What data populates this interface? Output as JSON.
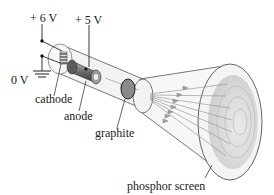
{
  "diagram": {
    "labels": {
      "v6": "+ 6 V",
      "v5": "+ 5 V",
      "v0": "0 V",
      "cathode": "cathode",
      "anode": "anode",
      "graphite": "graphite",
      "screen": "phosphor screen"
    },
    "colors": {
      "line": "#333333",
      "tube": "#eeeeee",
      "anode": "#7a7a7a",
      "graphite": "#8a8a8a",
      "screen": "#d9d9d9",
      "beam": "#9a9a9a"
    }
  }
}
